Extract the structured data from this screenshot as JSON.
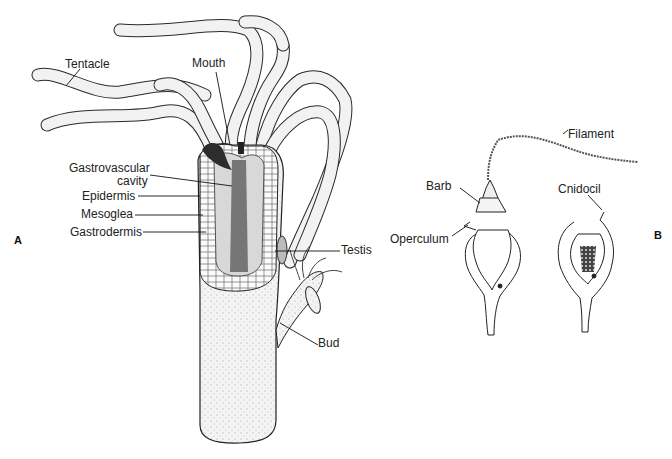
{
  "figure": {
    "panels": [
      {
        "id": "A",
        "label": "A",
        "subject": "Hydra body, cutaway",
        "labels": {
          "tentacle": "Tentacle",
          "mouth": "Mouth",
          "gastrovascular_1": "Gastrovascular",
          "gastrovascular_2": "cavity",
          "epidermis": "Epidermis",
          "mesoglea": "Mesoglea",
          "gastrodermis": "Gastrodermis",
          "testis": "Testis",
          "bud": "Bud"
        }
      },
      {
        "id": "B",
        "label": "B",
        "subject": "Nematocysts (discharged and undischarged)",
        "labels": {
          "filament": "Filament",
          "barb": "Barb",
          "operculum": "Operculum",
          "cnidocil": "Cnidocil"
        }
      }
    ],
    "colors": {
      "ink": "#1a1a1a",
      "stipple": "#cfcfcf",
      "body_fill": "#f3f3f3",
      "cavity": "#3a3a3a",
      "background": "#ffffff"
    }
  }
}
